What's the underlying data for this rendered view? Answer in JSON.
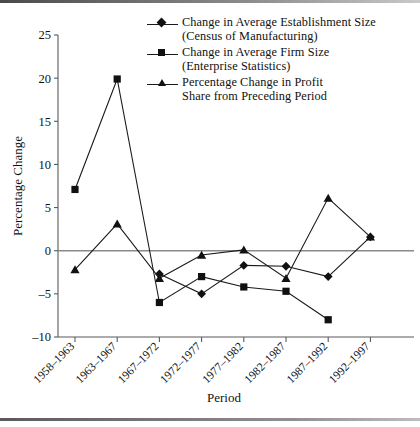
{
  "chart_data": {
    "type": "line",
    "title": "",
    "xlabel": "Period",
    "ylabel": "Percentage Change",
    "ylim": [
      -10,
      25
    ],
    "yticks": [
      -10,
      -5,
      0,
      5,
      10,
      15,
      20,
      25
    ],
    "ytick_labels": [
      "–10",
      "–5",
      "0",
      "5",
      "10",
      "15",
      "20",
      "25"
    ],
    "grid": false,
    "zero_line": true,
    "legend_position": "top-right",
    "categories": [
      "1958–1963",
      "1963–1967",
      "1967–1972",
      "1972–1977",
      "1977–1982",
      "1982–1987",
      "1987–1992",
      "1992–1997"
    ],
    "series": [
      {
        "name": "Change in Average Establishment Size (Census of Manufacturing)",
        "name_line1": "Change in Average Establishment Size",
        "name_line2": "(Census of Manufacturing)",
        "marker": "diamond",
        "color": "#111111",
        "values": [
          null,
          null,
          -2.7,
          -5.0,
          -1.7,
          -1.8,
          -3.0,
          1.6
        ]
      },
      {
        "name": "Change in  Average Firm  Size (Enterprise Statistics)",
        "name_line1": "Change in  Average Firm  Size",
        "name_line2": "(Enterprise Statistics)",
        "marker": "square",
        "color": "#111111",
        "values": [
          7.1,
          19.9,
          -6.0,
          -3.0,
          -4.2,
          -4.7,
          -8.0,
          null
        ]
      },
      {
        "name": "Percentage Change in Profit Share from Preceding Period",
        "name_line1": "Percentage Change in Profit",
        "name_line2": "Share from Preceding Period",
        "marker": "triangle",
        "color": "#111111",
        "values": [
          -2.2,
          3.1,
          -3.2,
          -0.5,
          0.1,
          -3.2,
          6.1,
          1.6
        ]
      }
    ]
  }
}
